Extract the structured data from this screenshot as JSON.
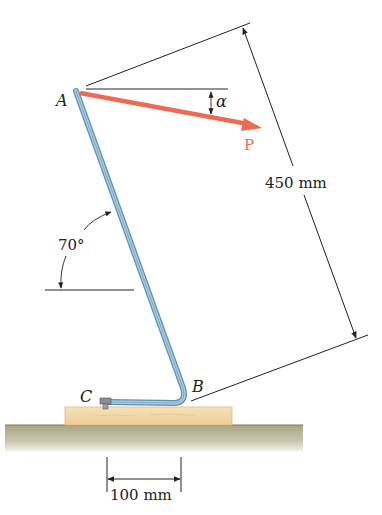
{
  "diagram": {
    "type": "statics-figure",
    "points": {
      "A": "A",
      "B": "B",
      "C": "C"
    },
    "force": {
      "label": "P",
      "angle_symbol": "α",
      "color": "#ee6a55"
    },
    "dimensions": {
      "length_AB": "450 mm",
      "horizontal_CB": "100 mm"
    },
    "angles": {
      "rod_angle": "70°"
    },
    "colors": {
      "rod": "#8fb8d4",
      "rod_edge": "#5f8fb0",
      "wood": "#f2d9a8",
      "ground": "#bdb79c",
      "force": "#ee6a55",
      "lines": "#222222"
    }
  }
}
